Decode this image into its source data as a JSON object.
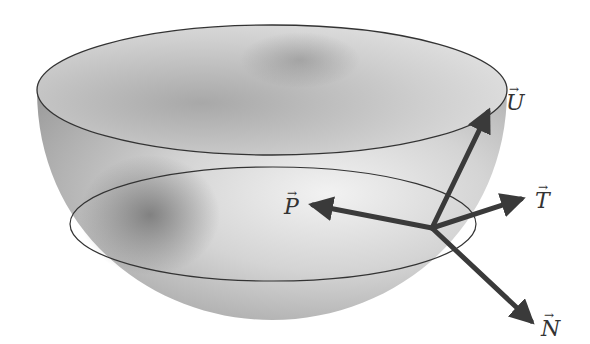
{
  "diagram": {
    "colors": {
      "surface_light": "#eeeeee",
      "surface_dark": "#8a8a8a",
      "outline": "#333333",
      "arrow": "#3a3a3a"
    },
    "bowl": {
      "top_ellipse": {
        "cx": 272,
        "cy": 90,
        "rx": 235,
        "ry": 65
      },
      "bottom_y": 320
    },
    "inner_circle": {
      "cx": 273,
      "cy": 224,
      "rx": 203,
      "ry": 57
    },
    "origin": {
      "x": 432,
      "y": 228
    },
    "vectors": [
      {
        "name": "U",
        "label": "U",
        "arrow": "→",
        "tip": {
          "x": 490,
          "y": 108
        },
        "label_pos": {
          "x": 506,
          "y": 92
        }
      },
      {
        "name": "T",
        "label": "T",
        "arrow": "→",
        "tip": {
          "x": 525,
          "y": 198
        },
        "label_pos": {
          "x": 535,
          "y": 190
        }
      },
      {
        "name": "P",
        "label": "P",
        "arrow": "→",
        "tip": {
          "x": 309,
          "y": 204
        },
        "label_pos": {
          "x": 284,
          "y": 196
        }
      },
      {
        "name": "N",
        "label": "N",
        "arrow": "→",
        "tip": {
          "x": 535,
          "y": 325
        },
        "label_pos": {
          "x": 541,
          "y": 318
        }
      }
    ]
  }
}
